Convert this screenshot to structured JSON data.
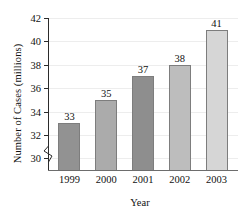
{
  "chart_data": {
    "type": "bar",
    "title": "",
    "xlabel": "Year",
    "ylabel": "Number of Cases (millions)",
    "categories": [
      "1999",
      "2000",
      "2001",
      "2002",
      "2003"
    ],
    "values": [
      33,
      35,
      37,
      38,
      41
    ],
    "value_labels": [
      "33",
      "35",
      "37",
      "38",
      "41"
    ],
    "ylim": [
      29,
      42
    ],
    "yticks": [
      30,
      32,
      34,
      36,
      38,
      40,
      42
    ],
    "ytick_labels": [
      "30",
      "32",
      "34",
      "36",
      "38",
      "40",
      "42"
    ],
    "grid": true,
    "legend": "none",
    "axis_break": true,
    "bar_colors": [
      "#929292",
      "#ababab",
      "#8e8e8e",
      "#bdbdbd",
      "#d6d6d6"
    ],
    "bar_border_color": "#7d7d7d",
    "gridline_color": "#ededed",
    "axis_color": "#2b2b2b",
    "text_color": "#111111",
    "background": "#ffffff"
  }
}
